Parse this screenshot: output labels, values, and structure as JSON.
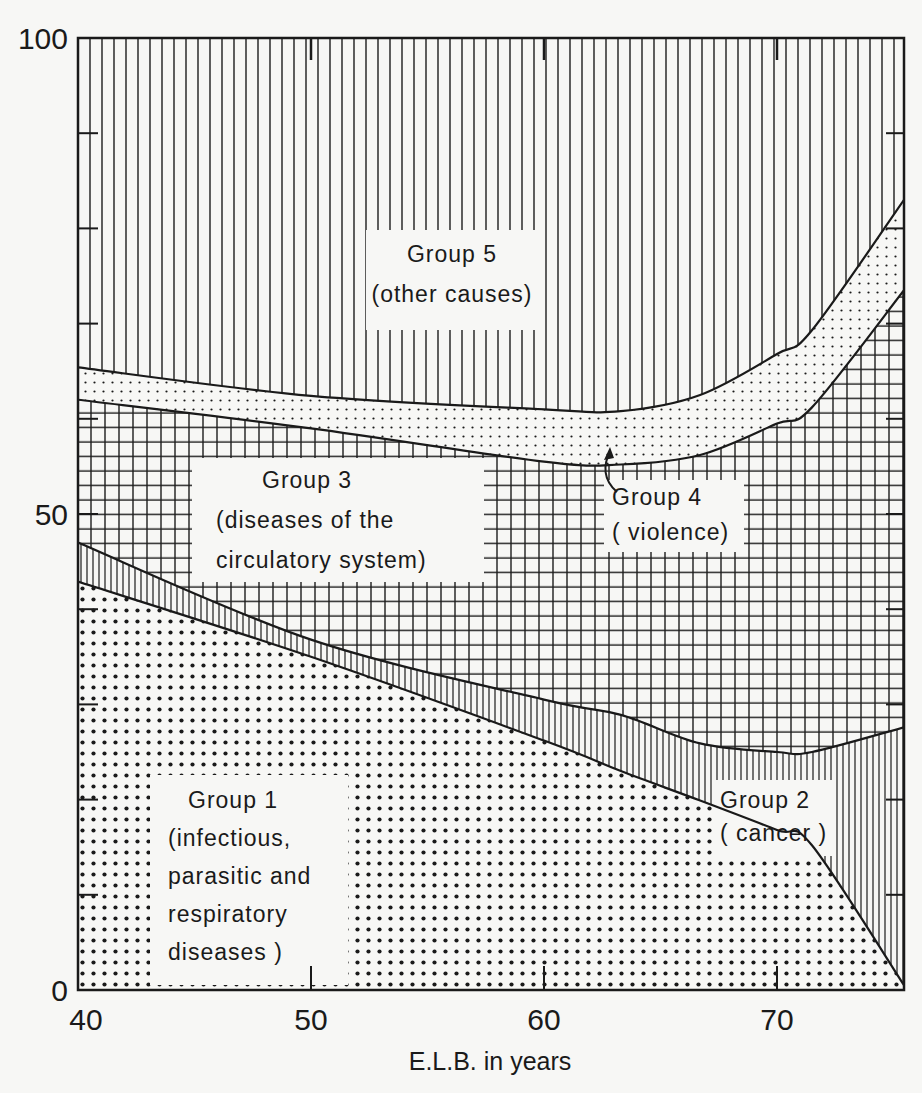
{
  "chart_data": {
    "type": "area",
    "stacked": true,
    "title": "",
    "xlabel": "E.L.B. in years",
    "ylabel": "",
    "xlim": [
      40,
      75.5
    ],
    "ylim": [
      0,
      100
    ],
    "x_ticks": [
      40,
      50,
      60,
      70
    ],
    "y_ticks": [
      0,
      50,
      100
    ],
    "y_minor_ticks": [
      10,
      20,
      30,
      40,
      60,
      70,
      80,
      90
    ],
    "grid": false,
    "legend": "inline labels",
    "x": [
      40,
      50,
      60,
      63.3,
      66.7,
      70,
      71.5,
      75.5
    ],
    "cumulative_boundaries": [
      {
        "name": "Group 1 upper boundary",
        "values": [
          42.9,
          35.0,
          26.2,
          23.0,
          19.9,
          16.8,
          15.2,
          0.5
        ]
      },
      {
        "name": "Group 2 upper boundary",
        "values": [
          47.0,
          36.8,
          30.5,
          28.9,
          25.9,
          25.0,
          25.0,
          27.6
        ]
      },
      {
        "name": "Group 3 upper boundary",
        "values": [
          62.0,
          59.0,
          55.5,
          55.2,
          56.2,
          59.5,
          61.2,
          73.5
        ]
      },
      {
        "name": "Group 4 upper boundary",
        "values": [
          65.4,
          62.4,
          61.0,
          60.8,
          62.5,
          66.8,
          69.3,
          83.0
        ]
      },
      {
        "name": "Group 5 upper boundary",
        "values": [
          100,
          100,
          100,
          100,
          100,
          100,
          100,
          100
        ]
      }
    ],
    "series": [
      {
        "name": "Group 1 (infectious, parasitic and respiratory diseases)",
        "pattern": "coarse dots",
        "values": [
          42.9,
          35.0,
          26.2,
          23.0,
          19.9,
          16.8,
          15.2,
          0.5
        ]
      },
      {
        "name": "Group 2 (cancer)",
        "pattern": "vertical lines",
        "values": [
          4.1,
          1.8,
          4.3,
          5.9,
          6.0,
          8.2,
          9.8,
          27.1
        ]
      },
      {
        "name": "Group 3 (diseases of the circulatory system)",
        "pattern": "grid",
        "values": [
          15.0,
          22.2,
          25.0,
          26.3,
          30.3,
          34.5,
          36.2,
          45.9
        ]
      },
      {
        "name": "Group 4 (violence)",
        "pattern": "fine dots",
        "values": [
          3.4,
          3.4,
          5.5,
          5.6,
          6.3,
          7.3,
          8.1,
          9.5
        ]
      },
      {
        "name": "Group 5 (other causes)",
        "pattern": "wide vertical lines",
        "values": [
          34.6,
          37.6,
          39.0,
          39.2,
          37.5,
          33.2,
          30.7,
          17.0
        ]
      }
    ],
    "annotations": [
      {
        "text": "Group 4 (violence)",
        "arrow_to": [
          62.5,
          55.3
        ]
      }
    ]
  },
  "labels": {
    "group1": [
      "Group 1",
      "(infectious,",
      "parasitic and",
      "respiratory",
      "diseases )"
    ],
    "group2": [
      "Group 2",
      "( cancer )"
    ],
    "group3": [
      "Group 3",
      "(diseases of the",
      "circulatory system)"
    ],
    "group4": [
      "Group 4",
      "( violence)"
    ],
    "group5": [
      "Group 5",
      "(other causes)"
    ]
  },
  "axes": {
    "x_title": "E.L.B. in years",
    "x_tick_labels": [
      "40",
      "50",
      "60",
      "70"
    ],
    "y_tick_labels": [
      "0",
      "50",
      "100"
    ]
  },
  "colors": {
    "ink": "#1a1a1a",
    "paper": "#f7f7f5"
  }
}
